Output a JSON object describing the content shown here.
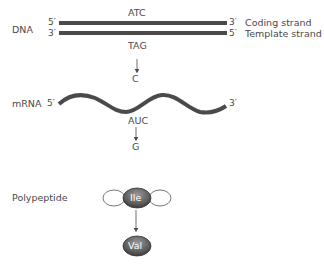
{
  "dna": {
    "label": "DNA",
    "coding_strand": {
      "left_end": "5′",
      "right_end": "3′",
      "name": "Coding strand",
      "codon": "ATC"
    },
    "template_strand": {
      "left_end": "3′",
      "right_end": "5′",
      "name": "Template strand",
      "codon": "TAG"
    },
    "mutation": "C"
  },
  "mrna": {
    "label": "mRNA",
    "left_end": "5′",
    "right_end": "3′",
    "codon": "AUC",
    "mutation": "G"
  },
  "polypeptide": {
    "label": "Polypeptide",
    "original_amino_acid": "Ile",
    "mutant_amino_acid": "Val"
  },
  "colors": {
    "strand": "#4a4a4a",
    "text": "#4a4a4a",
    "amino_acid_fill": "#6e6e6e",
    "amino_acid_text": "#ffffff"
  }
}
